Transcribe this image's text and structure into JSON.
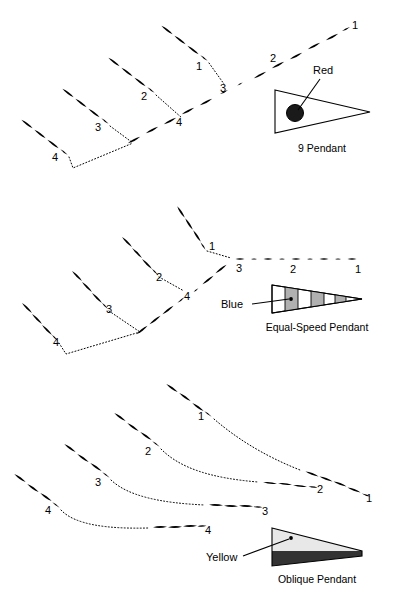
{
  "figure": {
    "background": "#ffffff",
    "ink": "#000000",
    "stripe_gray": "#b0b0b0",
    "oblique_light": "#e8e8e8",
    "oblique_dark": "#333333"
  },
  "panels": [
    {
      "id": "panel-9-pendant",
      "caption": "9 Pendant",
      "color_label": "Red",
      "color_hex": "#d00000",
      "symbol": "solid-circle-pendant",
      "track_numbers": [
        {
          "value": "1",
          "x": 352,
          "y": 29
        },
        {
          "value": "2",
          "x": 270,
          "y": 62
        },
        {
          "value": "1",
          "x": 196,
          "y": 70
        },
        {
          "value": "3",
          "x": 220,
          "y": 92
        },
        {
          "value": "2",
          "x": 141,
          "y": 100
        },
        {
          "value": "4",
          "x": 176,
          "y": 126
        },
        {
          "value": "3",
          "x": 95,
          "y": 131
        },
        {
          "value": "4",
          "x": 52,
          "y": 161
        }
      ]
    },
    {
      "id": "panel-equal-speed-pendant",
      "caption": "Equal-Speed Pendant",
      "color_label": "Blue",
      "color_hex": "#0040c0",
      "symbol": "striped-pendant",
      "track_numbers": [
        {
          "value": "1",
          "x": 355,
          "y": 273
        },
        {
          "value": "2",
          "x": 290,
          "y": 273
        },
        {
          "value": "3",
          "x": 236,
          "y": 272
        },
        {
          "value": "1",
          "x": 209,
          "y": 250
        },
        {
          "value": "2",
          "x": 156,
          "y": 281
        },
        {
          "value": "4",
          "x": 184,
          "y": 300
        },
        {
          "value": "3",
          "x": 106,
          "y": 313
        },
        {
          "value": "4",
          "x": 53,
          "y": 346
        }
      ]
    },
    {
      "id": "panel-oblique-pendant",
      "caption": "Oblique Pendant",
      "color_label": "Yellow",
      "color_hex": "#e8c000",
      "symbol": "half-dark-pendant",
      "track_numbers": [
        {
          "value": "1",
          "x": 198,
          "y": 420
        },
        {
          "value": "2",
          "x": 145,
          "y": 455
        },
        {
          "value": "3",
          "x": 95,
          "y": 486
        },
        {
          "value": "4",
          "x": 45,
          "y": 514
        },
        {
          "value": "1",
          "x": 366,
          "y": 502
        },
        {
          "value": "2",
          "x": 317,
          "y": 493
        },
        {
          "value": "3",
          "x": 262,
          "y": 515
        },
        {
          "value": "4",
          "x": 205,
          "y": 534
        }
      ]
    }
  ]
}
